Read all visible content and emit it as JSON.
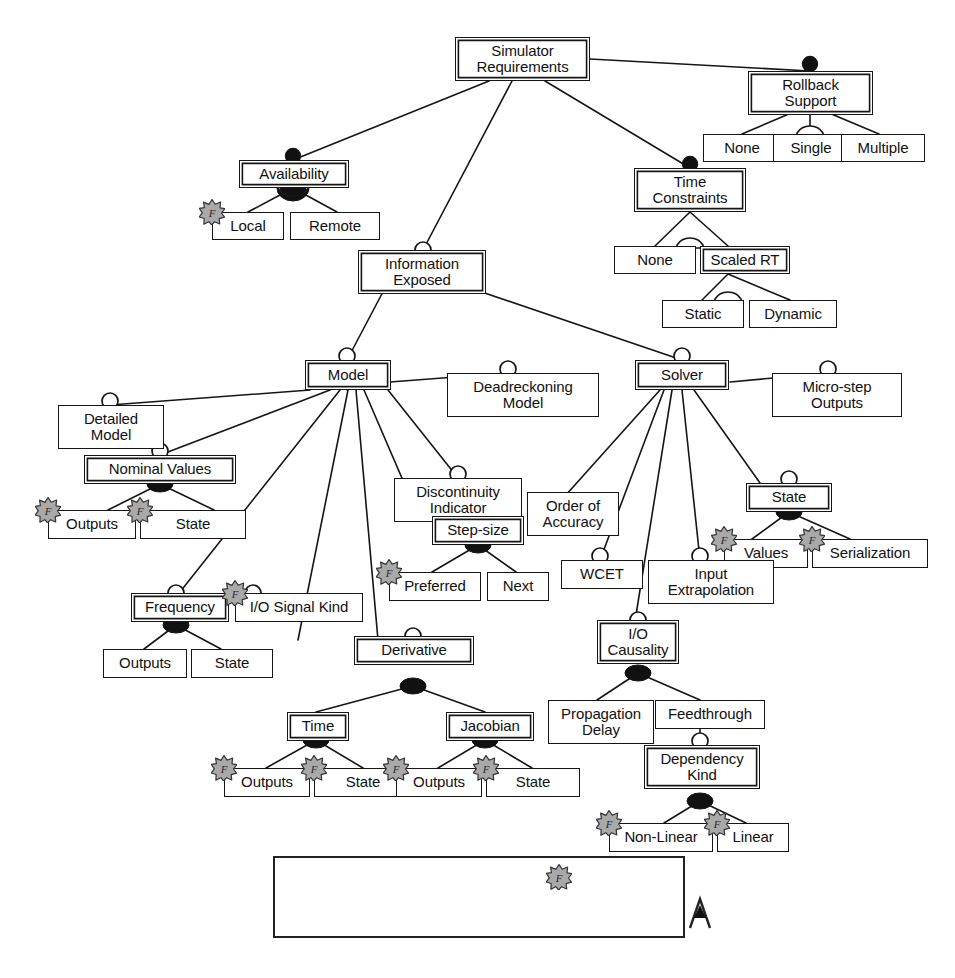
{
  "diagram": {
    "colors": {
      "line": "#151515",
      "box_border": "#151515",
      "background": "#ffffff",
      "fmi_fill": "#a9a9a9",
      "fmi_stroke": "#333333",
      "mandatory_fill": "#111111"
    },
    "nodes": {
      "simulator_requirements": "Simulator\nRequirements",
      "rollback_support": "Rollback\nSupport",
      "rollback_none": "None",
      "rollback_single": "Single",
      "rollback_multiple": "Multiple",
      "availability": "Availability",
      "availability_local": "Local",
      "availability_remote": "Remote",
      "time_constraints": "Time\nConstraints",
      "time_none": "None",
      "scaled_rt": "Scaled RT",
      "scaled_static": "Static",
      "scaled_dynamic": "Dynamic",
      "information_exposed": "Information\nExposed",
      "model": "Model",
      "solver": "Solver",
      "detailed_model": "Detailed\nModel",
      "nominal_values": "Nominal Values",
      "nominal_outputs": "Outputs",
      "nominal_state": "State",
      "deadreckoning_model": "Deadreckoning\nModel",
      "discontinuity_indicator": "Discontinuity\nIndicator",
      "micro_step_outputs": "Micro-step\nOutputs",
      "step_size": "Step-size",
      "step_preferred": "Preferred",
      "step_next": "Next",
      "order_of_accuracy": "Order of\nAccuracy",
      "wcet": "WCET",
      "solver_state": "State",
      "state_values": "Values",
      "state_serialization": "Serialization",
      "input_extrapolation": "Input\nExtrapolation",
      "frequency": "Frequency",
      "frequency_outputs": "Outputs",
      "frequency_state": "State",
      "io_signal_kind": "I/O Signal Kind",
      "derivative": "Derivative",
      "derivative_time": "Time",
      "time_outputs": "Outputs",
      "time_state": "State",
      "jacobian": "Jacobian",
      "jacobian_outputs": "Outputs",
      "jacobian_state": "State",
      "io_causality": "I/O\nCausality",
      "propagation_delay": "Propagation\nDelay",
      "feedthrough": "Feedthrough",
      "dependency_kind": "Dependency\nKind",
      "dep_non_linear": "Non-Linear",
      "dep_linear": "Linear"
    },
    "legend": {
      "abstract_feature": "Abstract Feature",
      "feature": "Feature",
      "fmi": "FMI CS 2.0",
      "mandatory": "Mandatory",
      "exclusive_or": "Exclusive Or",
      "optional": "Optional"
    }
  }
}
